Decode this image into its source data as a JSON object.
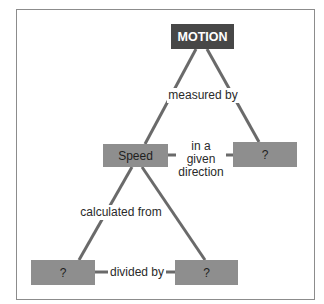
{
  "diagram": {
    "type": "concept-map",
    "colors": {
      "root_fill": "#474747",
      "node_fill": "#8e8e8e",
      "line": "#6a6a6a",
      "border": "#8c8c8c"
    },
    "nodes": {
      "motion": "MOTION",
      "speed": "Speed",
      "velocity": "?",
      "distance": "?",
      "time": "?"
    },
    "links": {
      "measured_by": "measured by",
      "given_direction_1": "in a",
      "given_direction_2": "given",
      "given_direction_3": "direction",
      "calculated_from": "calculated from",
      "divided_by": "divided by"
    }
  }
}
